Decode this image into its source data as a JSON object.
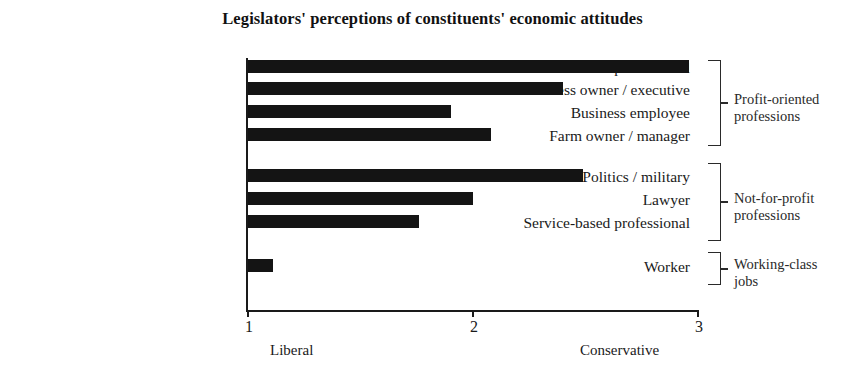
{
  "chart_data": {
    "type": "bar",
    "orientation": "horizontal",
    "title": "Legislators' perceptions of constituents' economic attitudes",
    "xlabel": "",
    "ylabel": "",
    "xlim": [
      1,
      3
    ],
    "xticks": [
      "1",
      "2",
      "3"
    ],
    "grid": false,
    "legend": "none",
    "axis_captions": {
      "low": "Liberal",
      "high": "Conservative"
    },
    "categories": [
      "Technical professional",
      "Business owner / executive",
      "Business employee",
      "Farm owner / manager",
      "Politics / military",
      "Lawyer",
      "Service-based professional",
      "Worker"
    ],
    "values": [
      2.96,
      2.4,
      1.9,
      2.08,
      2.49,
      2.0,
      1.76,
      1.11
    ],
    "groups": [
      {
        "label": "Profit-oriented\nprofessions",
        "label_line1": "Profit-oriented",
        "label_line2": "professions",
        "members": [
          0,
          1,
          2,
          3
        ]
      },
      {
        "label": "Not-for-profit\nprofessions",
        "label_line1": "Not-for-profit",
        "label_line2": "professions",
        "members": [
          4,
          5,
          6
        ]
      },
      {
        "label": "Working-class\njobs",
        "label_line1": "Working-class",
        "label_line2": "jobs",
        "members": [
          7
        ]
      }
    ],
    "bar_color": "#141414"
  }
}
